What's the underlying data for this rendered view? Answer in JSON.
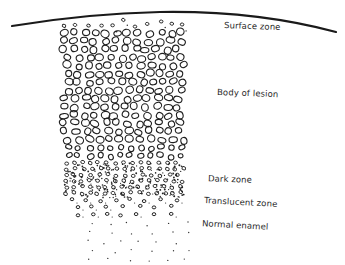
{
  "figure": {
    "type": "schematic cross-section of enamel lesion",
    "colors": {
      "ink": "#1a1a1a",
      "label": "#2a2a2a",
      "background": "#ffffff"
    }
  },
  "labels": {
    "surface_zone": "Surface zone",
    "body_of_lesion": "Body of lesion",
    "dark_zone": "Dark zone",
    "translucent_zone": "Translucent zone",
    "normal_enamel": "Normal enamel"
  },
  "zones": [
    {
      "id": "surface",
      "name": "Surface zone",
      "pattern": "small sparse circles and dots under surface line"
    },
    {
      "id": "body",
      "name": "Body of lesion",
      "pattern": "large densely packed open circles"
    },
    {
      "id": "dark",
      "name": "Dark zone",
      "pattern": "small circles mixed with dense dots"
    },
    {
      "id": "translucent",
      "name": "Translucent zone",
      "pattern": "sparse small circles and dots"
    },
    {
      "id": "normal",
      "name": "Normal enamel",
      "pattern": "sparse tiny dots"
    }
  ]
}
